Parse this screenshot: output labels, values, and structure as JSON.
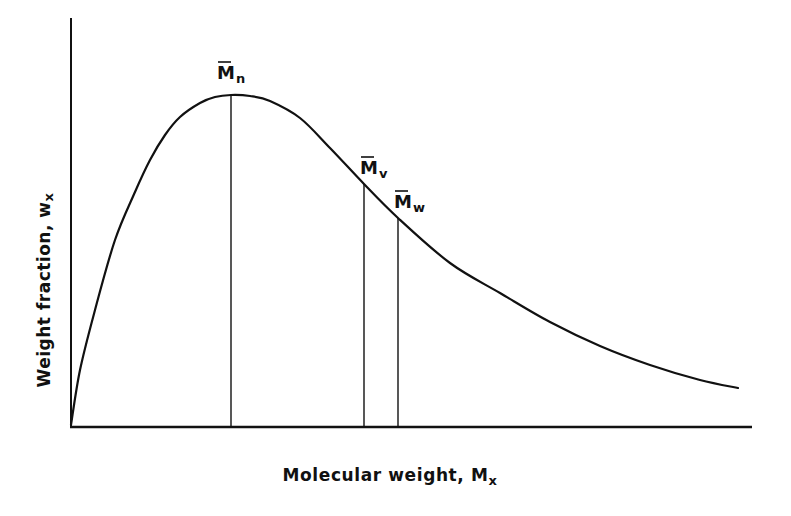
{
  "chart_data": {
    "type": "line",
    "title": "",
    "xlabel": "Molecular weight, Mx",
    "ylabel": "Weight fraction, wx",
    "xlabel_main": "Molecular weight, M",
    "xlabel_sub": "x",
    "ylabel_main": "Weight fraction, w",
    "ylabel_sub": "x",
    "grid": false,
    "ticks": false,
    "series": [
      {
        "name": "Molecular weight distribution",
        "description": "Skewed distribution curve rising from origin to a maximum, then tailing off",
        "points_px": [
          [
            71,
            425
          ],
          [
            80,
            370
          ],
          [
            95,
            310
          ],
          [
            115,
            240
          ],
          [
            135,
            192
          ],
          [
            150,
            160
          ],
          [
            165,
            135
          ],
          [
            180,
            117
          ],
          [
            200,
            103
          ],
          [
            215,
            97
          ],
          [
            231,
            95
          ],
          [
            250,
            96
          ],
          [
            270,
            101
          ],
          [
            300,
            118
          ],
          [
            330,
            148
          ],
          [
            364,
            184
          ],
          [
            398,
            218
          ],
          [
            450,
            263
          ],
          [
            500,
            293
          ],
          [
            550,
            322
          ],
          [
            600,
            346
          ],
          [
            650,
            365
          ],
          [
            700,
            380
          ],
          [
            738,
            388
          ]
        ]
      }
    ],
    "annotations": [
      {
        "label": "M̄n",
        "main": "M",
        "sub": "n",
        "x_px": 231,
        "y_top_px": 95,
        "meaning": "number-average molecular weight (at peak)"
      },
      {
        "label": "M̄v",
        "main": "M",
        "sub": "v",
        "x_px": 364,
        "y_top_px": 184,
        "meaning": "viscosity-average molecular weight"
      },
      {
        "label": "M̄w",
        "main": "M",
        "sub": "w",
        "x_px": 398,
        "y_top_px": 218,
        "meaning": "weight-average molecular weight"
      }
    ],
    "axes": {
      "origin_px": [
        71,
        427
      ],
      "x_end_px": 752,
      "y_top_px": 18
    }
  },
  "colors": {
    "ink": "#111111",
    "background": "#ffffff"
  }
}
